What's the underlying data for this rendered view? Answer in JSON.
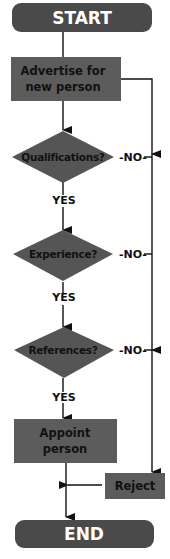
{
  "colors": {
    "terminal": "#4a4a4a",
    "process": "#5c5c5c",
    "decision": "#555555",
    "line": "#111111"
  },
  "nodes": {
    "start": "START",
    "advertise": [
      "Advertise for",
      "new person"
    ],
    "qualifications": "Qualifications?",
    "experience": "Experience?",
    "references": "References?",
    "appoint": [
      "Appoint",
      "person"
    ],
    "reject": "Reject",
    "end": "END"
  },
  "labels": {
    "no": "-NO-",
    "yes": "YES"
  }
}
